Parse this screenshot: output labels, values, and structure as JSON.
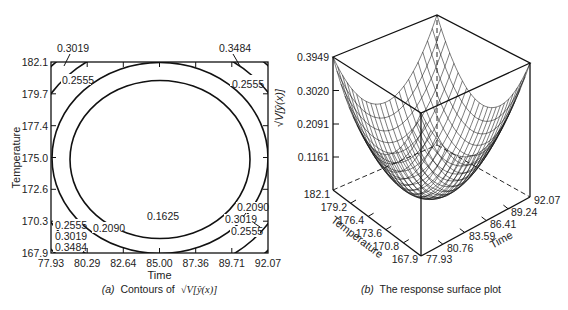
{
  "chart_data": [
    {
      "type": "contour",
      "panel": "a",
      "title": "Contours of √V[ŷ(x)]",
      "caption_prefix": "(a)",
      "caption_text": "Contours of",
      "caption_math": "√V[ŷ(x)]",
      "xlabel": "Time",
      "ylabel": "Temperature",
      "x_ticks": [
        "77.93",
        "80.29",
        "82.64",
        "85.00",
        "87.36",
        "89.71",
        "92.07"
      ],
      "y_ticks": [
        "182.1",
        "179.7",
        "177.4",
        "175.0",
        "172.6",
        "170.3",
        "167.9"
      ],
      "xlim": [
        77.93,
        92.07
      ],
      "ylim": [
        167.9,
        182.1
      ],
      "contour_levels": [
        0.1625,
        0.209,
        0.2555,
        0.3019,
        0.3484
      ],
      "labels": [
        {
          "text": "0.3019",
          "pos": "top-left"
        },
        {
          "text": "0.2555",
          "pos": "top-left-inner"
        },
        {
          "text": "0.3484",
          "pos": "top-right"
        },
        {
          "text": "0.2555",
          "pos": "top-right-inner"
        },
        {
          "text": "0.2555",
          "pos": "bottom-left-1"
        },
        {
          "text": "0.3019",
          "pos": "bottom-left-2"
        },
        {
          "text": "0.3484",
          "pos": "bottom-left-3"
        },
        {
          "text": "0.2090",
          "pos": "bottom-left-ring"
        },
        {
          "text": "0.1625",
          "pos": "bottom-center"
        },
        {
          "text": "0.2090",
          "pos": "bottom-right-1"
        },
        {
          "text": "0.3019",
          "pos": "bottom-right-2"
        },
        {
          "text": "0.2555",
          "pos": "bottom-right-3"
        }
      ],
      "grid": false
    },
    {
      "type": "surface3d",
      "panel": "b",
      "title": "The response surface plot",
      "caption_prefix": "(b)",
      "caption_text": "The response surface plot",
      "zlabel": "√V[ŷ(x)]",
      "xlabel": "Time",
      "ylabel": "Temperature",
      "z_ticks": [
        "0.3949",
        "0.3020",
        "0.2091",
        "0.1161"
      ],
      "zlim": [
        0.1161,
        0.3949
      ],
      "temperature_ticks": [
        "182.1",
        "179.2",
        "176.4",
        "173.6",
        "170.8",
        "167.9"
      ],
      "time_ticks": [
        "77.93",
        "80.76",
        "83.59",
        "86.41",
        "89.24",
        "92.07"
      ],
      "surface": "bowl-shaped paraboloid, minimum ~0.1161 at center (85.00, 175.0), maximum 0.3949 at corners",
      "grid": "wireframe mesh"
    }
  ],
  "panel_a": {
    "x_ticks": [
      "77.93",
      "80.29",
      "82.64",
      "85.00",
      "87.36",
      "89.71",
      "92.07"
    ],
    "y_ticks": [
      "182.1",
      "179.7",
      "177.4",
      "175.0",
      "172.6",
      "170.3",
      "167.9"
    ],
    "xlabel": "Time",
    "ylabel": "Temperature",
    "caption_prefix": "(a)",
    "caption_text": "Contours of",
    "caption_math": "√V[ŷ(x)]",
    "labels": {
      "tl_outer": "0.3019",
      "tl_inner": "0.2555",
      "tr_outer": "0.3484",
      "tr_inner": "0.2555",
      "bl_1": "0.2555",
      "bl_2": "0.3019",
      "bl_3": "0.3484",
      "bl_ring": "0.2090",
      "center": "0.1625",
      "br_1": "0.2090",
      "br_2": "0.3019",
      "br_3": "0.2555"
    }
  },
  "panel_b": {
    "z_ticks": [
      "0.3949",
      "0.3020",
      "0.2091",
      "0.1161"
    ],
    "zlabel": "√V[ŷ(x)]",
    "temperature_ticks": [
      "182.1",
      "179.2",
      "176.4",
      "173.6",
      "170.8",
      "167.9"
    ],
    "time_ticks": [
      "77.93",
      "80.76",
      "83.59",
      "86.41",
      "89.24",
      "92.07"
    ],
    "temperature_label": "Temperature",
    "time_label": "Time",
    "caption_prefix": "(b)",
    "caption_text": "The response surface plot"
  }
}
